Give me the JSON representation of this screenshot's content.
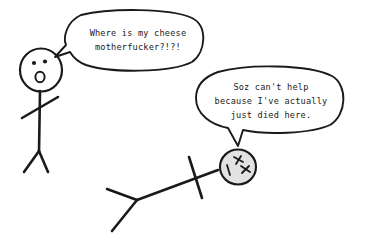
{
  "scene": {
    "title": "Stick figure comic",
    "background_color": "#ffffff",
    "ink_color": "#1a1a1a",
    "dead_head_fill_color": "#e2e2e2"
  },
  "speech_bubbles": [
    {
      "id": "bubble-standing",
      "speaker": "standing-stick-figure",
      "tail_direction": "left-down",
      "lines": [
        "Where is my cheese",
        "motherfucker?!?!"
      ]
    },
    {
      "id": "bubble-dead",
      "speaker": "dead-stick-figure",
      "tail_direction": "down",
      "lines": [
        "Soz can't help",
        "because I've actually",
        "just died here."
      ]
    }
  ],
  "characters": [
    {
      "id": "standing-stick-figure",
      "name": "standing-stick-figure",
      "pose": "standing",
      "face": "surprised",
      "eyes": "two-dots",
      "mouth": "open-oval"
    },
    {
      "id": "dead-stick-figure",
      "name": "dead-stick-figure",
      "pose": "lying-down-diagonal",
      "face": "dead",
      "eyes": "two-x-marks",
      "mouth": "straight-line"
    }
  ]
}
